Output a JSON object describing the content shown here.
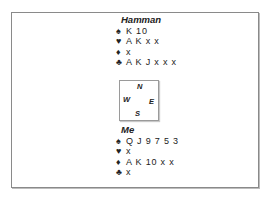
{
  "deal": {
    "north": {
      "name": "Hamman",
      "spades": "K 10",
      "hearts": "A K x x",
      "diamonds": "x",
      "clubs": "A K J x x x"
    },
    "south": {
      "name": "Me",
      "spades": "Q J 9 7 5 3",
      "hearts": "x",
      "diamonds": "A K 10 x x",
      "clubs": "x"
    },
    "compass": {
      "n": "N",
      "e": "E",
      "s": "S",
      "w": "W"
    },
    "suit_symbols": {
      "spades": "♠",
      "hearts": "♥",
      "diamonds": "♦",
      "clubs": "♣"
    }
  }
}
